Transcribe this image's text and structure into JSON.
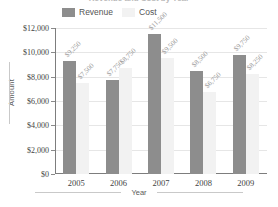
{
  "chart_data": {
    "type": "bar",
    "title": "Revenue and Cost by Year",
    "xlabel": "Year",
    "ylabel": "Amount",
    "categories": [
      "2005",
      "2006",
      "2007",
      "2008",
      "2009"
    ],
    "ylim": [
      0,
      12000
    ],
    "ytick_labels": [
      "$12,000",
      "$10,000",
      "$8,000",
      "$6,000",
      "$4,000",
      "$2,000",
      "$0"
    ],
    "ytick_values": [
      12000,
      10000,
      8000,
      6000,
      4000,
      2000,
      0
    ],
    "grid": true,
    "legend_position": "top",
    "series": [
      {
        "name": "Revenue",
        "color": "#8d8d8d",
        "values": [
          9250,
          7750,
          11500,
          8500,
          9750
        ],
        "labels": [
          "$9,250",
          "$7,750",
          "$11,500",
          "$8,500",
          "$9,750"
        ]
      },
      {
        "name": "Cost",
        "color": "#f2f2f2",
        "values": [
          7500,
          8750,
          9500,
          6750,
          8250
        ],
        "labels": [
          "$7,500",
          "$8,750",
          "$9,500",
          "$6,750",
          "$8,250"
        ]
      }
    ]
  }
}
